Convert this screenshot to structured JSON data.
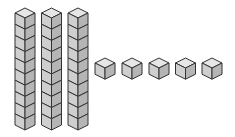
{
  "diagram": {
    "title": "Base-ten blocks",
    "tens_rods": {
      "count": 3,
      "cubes_per_rod": 10
    },
    "unit_cubes": {
      "count": 5
    },
    "value_represented": 35,
    "colors": {
      "top_face": "#e6e6e6",
      "left_face": "#cfcfcf",
      "right_face": "#b5b5b5",
      "edge": "#333333"
    }
  }
}
